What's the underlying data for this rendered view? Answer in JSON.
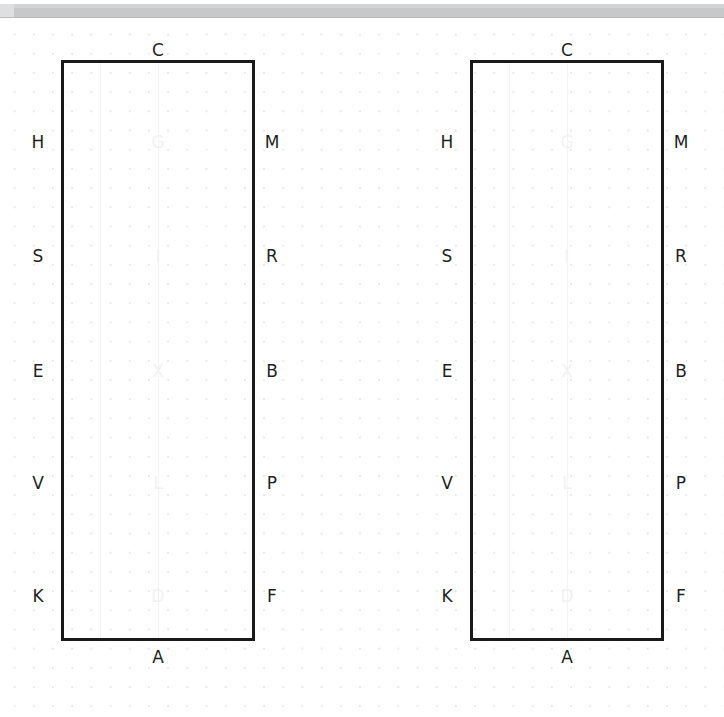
{
  "window": {
    "toolbar_present": true,
    "toolbar_color": "#c6c8ca",
    "background_color": "#ffffff",
    "grid_dot_color": "#e9e9ec"
  },
  "canvas": {
    "shape_outline_color": "#1a1a1a",
    "label_color": "#1f1f1f",
    "ghost_label_color": "#f2f2f4"
  },
  "diagrams": [
    {
      "id": "diagram-left",
      "top_label": "C",
      "bottom_label": "A",
      "left_labels": [
        "H",
        "S",
        "E",
        "V",
        "K"
      ],
      "right_labels": [
        "M",
        "R",
        "B",
        "P",
        "F"
      ],
      "center_labels": [
        "G",
        "I",
        "X",
        "L",
        "D"
      ]
    },
    {
      "id": "diagram-right",
      "top_label": "C",
      "bottom_label": "A",
      "left_labels": [
        "H",
        "S",
        "E",
        "V",
        "K"
      ],
      "right_labels": [
        "M",
        "R",
        "B",
        "P",
        "F"
      ],
      "center_labels": [
        "G",
        "I",
        "X",
        "L",
        "D"
      ]
    }
  ]
}
